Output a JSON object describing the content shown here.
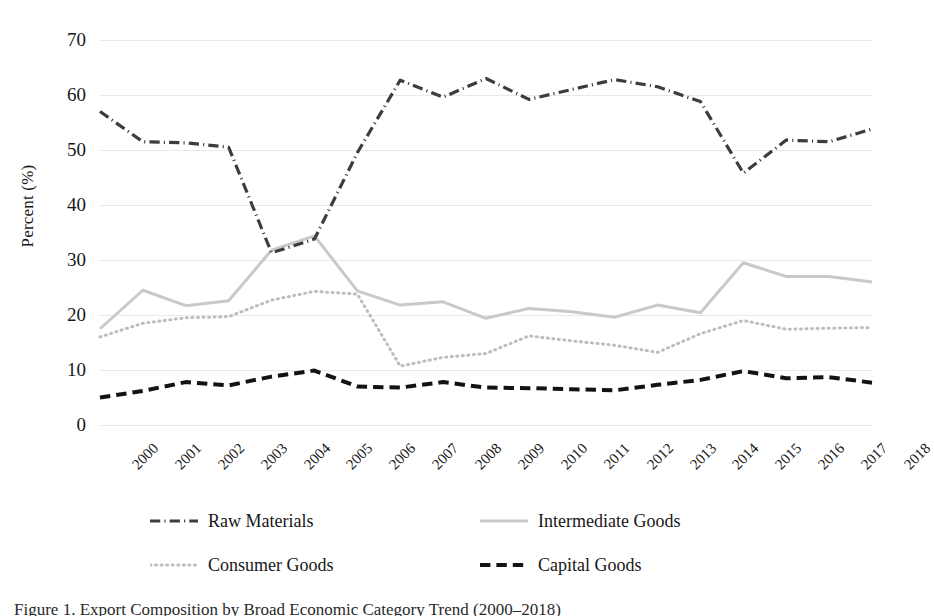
{
  "figure": {
    "caption": "Figure 1. Export Composition by Broad Economic Category Trend (2000–2018)"
  },
  "chart_data": {
    "type": "line",
    "title": "",
    "xlabel": "",
    "ylabel": "Percent (%)",
    "ylim": [
      0,
      70
    ],
    "ytick_step": 10,
    "yticks": [
      "0",
      "10",
      "20",
      "30",
      "40",
      "50",
      "60",
      "70"
    ],
    "grid": "horizontal",
    "legend_position": "bottom",
    "categories": [
      "2000",
      "2001",
      "2002",
      "2003",
      "2004",
      "2005",
      "2006",
      "2007",
      "2008",
      "2009",
      "2010",
      "2011",
      "2012",
      "2013",
      "2014",
      "2015",
      "2016",
      "2017",
      "2018"
    ],
    "series": [
      {
        "name": "Raw Materials",
        "color": "#3d3d3d",
        "style": "dash-dot",
        "width": 3.2,
        "values": [
          57.0,
          51.5,
          51.3,
          50.5,
          31.3,
          33.8,
          49.5,
          62.7,
          59.6,
          63.0,
          59.2,
          61.0,
          62.8,
          61.5,
          58.8,
          45.8,
          51.8,
          51.5,
          53.8
        ]
      },
      {
        "name": "Intermediate Goods",
        "color": "#c9c9c9",
        "style": "solid",
        "width": 3.0,
        "values": [
          17.5,
          24.5,
          21.7,
          22.6,
          31.8,
          34.4,
          24.4,
          21.8,
          22.4,
          19.4,
          21.2,
          20.6,
          19.6,
          21.8,
          20.4,
          29.5,
          27.0,
          27.0,
          26.0
        ]
      },
      {
        "name": "Consumer Goods",
        "color": "#bdbdbd",
        "style": "dotted",
        "width": 3.0,
        "values": [
          16.0,
          18.5,
          19.5,
          19.7,
          22.7,
          24.3,
          23.8,
          10.7,
          12.3,
          13.0,
          16.2,
          15.3,
          14.5,
          13.2,
          16.6,
          19.0,
          17.4,
          17.6,
          17.7
        ]
      },
      {
        "name": "Capital Goods",
        "color": "#131313",
        "style": "dashed",
        "width": 4.0,
        "values": [
          5.0,
          6.2,
          7.8,
          7.2,
          8.8,
          9.9,
          7.0,
          6.8,
          7.8,
          6.8,
          6.7,
          6.5,
          6.3,
          7.3,
          8.2,
          9.8,
          8.5,
          8.7,
          7.7
        ]
      }
    ]
  }
}
